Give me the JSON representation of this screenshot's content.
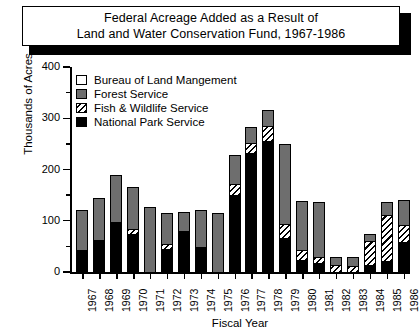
{
  "title": {
    "line1": "Federal Acreage Added as a Result of",
    "line2": "Land and Water Conservation Fund, 1967-1986"
  },
  "legend": {
    "position": "top-left-inside",
    "items": [
      {
        "key": "blm",
        "label": "Bureau of Land Mangement",
        "swatch": "white-square-icon",
        "color": "#ffffff"
      },
      {
        "key": "fs",
        "label": "Forest Service",
        "swatch": "gray-square-icon",
        "color": "#6e6e6e"
      },
      {
        "key": "fws",
        "label": "Fish & Wildlife Service",
        "swatch": "hatched-square-icon",
        "color": "#000000"
      },
      {
        "key": "nps",
        "label": "National Park Service",
        "swatch": "black-square-icon",
        "color": "#000000"
      }
    ]
  },
  "axes": {
    "y_title": "Thousands of Acres",
    "x_title": "Fiscal Year",
    "y_ticks": [
      "0",
      "100",
      "200",
      "300",
      "400"
    ],
    "y_minor_ticks": [
      "50",
      "150",
      "250",
      "350"
    ]
  },
  "chart_data": {
    "type": "bar",
    "stacked": true,
    "title": "Federal Acreage Added as a Result of Land and Water Conservation Fund, 1967-1986",
    "xlabel": "Fiscal Year",
    "ylabel": "Thousands of Acres",
    "ylim": [
      0,
      400
    ],
    "ytick_interval": 100,
    "yminor_interval": 50,
    "grid": false,
    "legend_position": "upper left",
    "categories": [
      "1967",
      "1968",
      "1969",
      "1970",
      "1971",
      "1972",
      "1973",
      "1974",
      "1975",
      "1976",
      "1977",
      "1978",
      "1979",
      "1980",
      "1981",
      "1982",
      "1983",
      "1984",
      "1985",
      "1986"
    ],
    "series": [
      {
        "name": "National Park Service",
        "key": "nps",
        "color": "#000000",
        "values": [
          45,
          65,
          100,
          75,
          0,
          47,
          83,
          51,
          0,
          152,
          235,
          258,
          68,
          25,
          18,
          0,
          0,
          14,
          22,
          60
        ]
      },
      {
        "name": "Fish & Wildlife Service",
        "key": "fws",
        "color": "hatch",
        "values": [
          0,
          0,
          0,
          10,
          0,
          9,
          0,
          0,
          0,
          22,
          20,
          30,
          28,
          20,
          12,
          15,
          14,
          50,
          92,
          35
        ]
      },
      {
        "name": "Forest Service",
        "key": "fs",
        "color": "#6e6e6e",
        "values": [
          78,
          82,
          92,
          82,
          128,
          62,
          36,
          71,
          118,
          57,
          30,
          30,
          156,
          95,
          108,
          16,
          18,
          13,
          25,
          47
        ]
      },
      {
        "name": "Bureau of Land Mangement",
        "key": "blm",
        "color": "#ffffff",
        "values": [
          0,
          0,
          0,
          0,
          0,
          0,
          0,
          0,
          0,
          0,
          0,
          0,
          0,
          0,
          0,
          0,
          0,
          0,
          0,
          0
        ]
      }
    ],
    "totals": [
      123,
      147,
      192,
      167,
      128,
      118,
      119,
      122,
      118,
      231,
      285,
      318,
      252,
      140,
      138,
      31,
      32,
      77,
      139,
      142
    ]
  }
}
